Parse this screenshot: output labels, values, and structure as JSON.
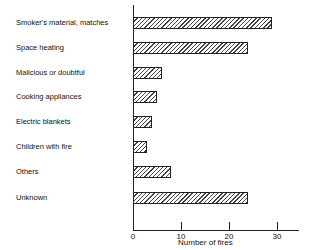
{
  "chart_data": {
    "type": "bar",
    "orientation": "horizontal",
    "title": "",
    "xlabel": "Number of fires",
    "ylabel": "",
    "categories": [
      "Smoker's material, matches",
      "Space heating",
      "Malicious or doubtful",
      "Cooking appliances",
      "Electric blankets",
      "Children with fire",
      "Others",
      "Unknown"
    ],
    "values": [
      29,
      24,
      6,
      5,
      4,
      3,
      8,
      24
    ],
    "xlim": [
      0,
      34
    ],
    "xticks": [
      "0",
      "10",
      "20",
      "30"
    ],
    "grid": false,
    "legend": null,
    "fill": "diagonal hatch"
  }
}
